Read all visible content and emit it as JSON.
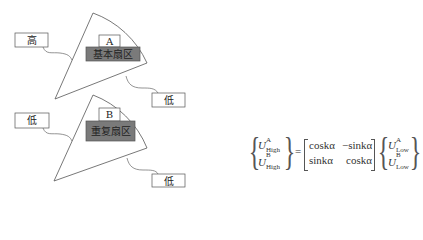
{
  "diagram": {
    "sector_a": {
      "label": "A",
      "region_label": "基本扇区",
      "left_port": "高",
      "right_port": "低"
    },
    "sector_b": {
      "label": "B",
      "region_label": "重复扇区",
      "left_port": "低",
      "right_port": "低"
    },
    "colors": {
      "outline": "#555555",
      "region_fill": "#7a7a7a",
      "label_box_fill": "#ffffff"
    }
  },
  "formula": {
    "lhs_top_var": "U",
    "lhs_top_sup": "A",
    "lhs_top_sub": "High",
    "lhs_bot_var": "U",
    "lhs_bot_sup": "B",
    "lhs_bot_sub": "High",
    "equals": "=",
    "m11": "coskα",
    "m12": "−sinkα",
    "m21": "sinkα",
    "m22": "coskα",
    "rhs_top_var": "U",
    "rhs_top_sup": "A",
    "rhs_top_sub": "Low",
    "rhs_bot_var": "U",
    "rhs_bot_sup": "B",
    "rhs_bot_sub": "Low"
  }
}
